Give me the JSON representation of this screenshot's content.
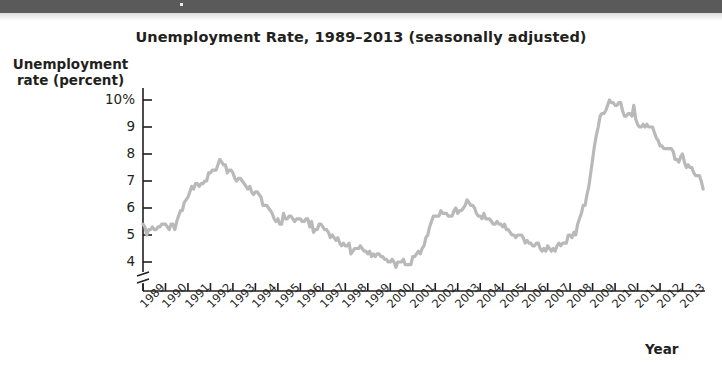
{
  "figure": {
    "title": "Unemployment Rate, 1989–2013 (seasonally adjusted)",
    "y_axis_title_line1": "Unemployment",
    "y_axis_title_line2": "rate (percent)",
    "x_axis_title": "Year"
  },
  "style": {
    "line_color": "#b9b9b9",
    "axis_color": "#231f20",
    "text_color": "#231f20",
    "band_color": "#5a5a5a",
    "background": "#ffffff"
  },
  "chart_data": {
    "type": "line",
    "title": "Unemployment Rate, 1989–2013 (seasonally adjusted)",
    "xlabel": "Year",
    "ylabel": "Unemployment rate (percent)",
    "xlim": [
      1989,
      2013.92
    ],
    "ylim": [
      3.6,
      10.6
    ],
    "ytick_labels": [
      "10%",
      "9",
      "8",
      "7",
      "6",
      "5",
      "4"
    ],
    "ytick_values": [
      10,
      9,
      8,
      7,
      6,
      5,
      4
    ],
    "xtick_labels": [
      "1989",
      "1990",
      "1991",
      "1992",
      "1993",
      "1994",
      "1995",
      "1996",
      "1997",
      "1998",
      "1999",
      "2000",
      "2001",
      "2002",
      "2003",
      "2004",
      "2005",
      "2006",
      "2007",
      "2008",
      "2009",
      "2010",
      "2011",
      "2012",
      "2013"
    ],
    "xtick_values": [
      1989,
      1990,
      1991,
      1992,
      1993,
      1994,
      1995,
      1996,
      1997,
      1998,
      1999,
      2000,
      2001,
      2002,
      2003,
      2004,
      2005,
      2006,
      2007,
      2008,
      2009,
      2010,
      2011,
      2012,
      2013
    ],
    "grid": false,
    "legend": false,
    "axis_break_y": true,
    "units": "percent",
    "frequency": "monthly",
    "series": [
      {
        "name": "Unemployment rate",
        "color": "#b9b9b9",
        "x_start": 1989.0,
        "x_step": 0.0833333,
        "values": [
          5.4,
          5.3,
          5.0,
          5.2,
          5.2,
          5.3,
          5.2,
          5.2,
          5.3,
          5.3,
          5.4,
          5.4,
          5.4,
          5.3,
          5.2,
          5.4,
          5.4,
          5.2,
          5.5,
          5.7,
          5.9,
          5.9,
          6.2,
          6.3,
          6.4,
          6.6,
          6.8,
          6.7,
          6.9,
          6.9,
          6.8,
          6.9,
          6.9,
          7.0,
          7.0,
          7.3,
          7.3,
          7.4,
          7.4,
          7.4,
          7.6,
          7.8,
          7.7,
          7.6,
          7.6,
          7.3,
          7.4,
          7.4,
          7.3,
          7.1,
          7.0,
          7.1,
          7.1,
          7.0,
          6.9,
          6.8,
          6.7,
          6.8,
          6.6,
          6.5,
          6.6,
          6.6,
          6.5,
          6.4,
          6.1,
          6.1,
          6.1,
          6.0,
          5.9,
          5.8,
          5.6,
          5.5,
          5.6,
          5.4,
          5.4,
          5.8,
          5.6,
          5.6,
          5.7,
          5.7,
          5.6,
          5.5,
          5.6,
          5.6,
          5.6,
          5.5,
          5.5,
          5.6,
          5.6,
          5.3,
          5.5,
          5.1,
          5.2,
          5.2,
          5.4,
          5.4,
          5.3,
          5.2,
          5.2,
          5.1,
          4.9,
          5.0,
          4.9,
          4.8,
          4.9,
          4.7,
          4.6,
          4.7,
          4.6,
          4.6,
          4.7,
          4.3,
          4.4,
          4.5,
          4.5,
          4.5,
          4.6,
          4.5,
          4.4,
          4.4,
          4.3,
          4.4,
          4.2,
          4.3,
          4.2,
          4.3,
          4.3,
          4.2,
          4.2,
          4.1,
          4.1,
          4.0,
          4.0,
          4.1,
          4.0,
          3.8,
          4.0,
          4.0,
          4.0,
          4.1,
          3.9,
          3.9,
          3.9,
          3.9,
          4.2,
          4.2,
          4.3,
          4.4,
          4.3,
          4.5,
          4.6,
          4.9,
          5.0,
          5.3,
          5.5,
          5.7,
          5.7,
          5.7,
          5.7,
          5.9,
          5.8,
          5.8,
          5.8,
          5.7,
          5.7,
          5.7,
          5.9,
          6.0,
          5.8,
          5.9,
          5.9,
          6.0,
          6.1,
          6.3,
          6.2,
          6.1,
          6.1,
          6.0,
          5.8,
          5.7,
          5.7,
          5.6,
          5.8,
          5.6,
          5.6,
          5.6,
          5.5,
          5.4,
          5.4,
          5.5,
          5.4,
          5.4,
          5.3,
          5.4,
          5.2,
          5.2,
          5.1,
          5.0,
          5.0,
          4.9,
          5.0,
          5.0,
          5.0,
          4.9,
          4.7,
          4.8,
          4.7,
          4.7,
          4.6,
          4.6,
          4.7,
          4.7,
          4.5,
          4.4,
          4.5,
          4.4,
          4.6,
          4.5,
          4.4,
          4.5,
          4.4,
          4.6,
          4.7,
          4.6,
          4.7,
          4.7,
          4.7,
          5.0,
          5.0,
          4.9,
          5.1,
          5.0,
          5.4,
          5.6,
          5.8,
          6.1,
          6.1,
          6.5,
          6.8,
          7.3,
          7.8,
          8.3,
          8.7,
          9.0,
          9.4,
          9.5,
          9.5,
          9.6,
          9.8,
          10.0,
          9.9,
          9.9,
          9.8,
          9.8,
          9.9,
          9.9,
          9.6,
          9.4,
          9.4,
          9.5,
          9.5,
          9.4,
          9.8,
          9.3,
          9.1,
          9.0,
          9.0,
          9.1,
          9.0,
          9.1,
          9.0,
          9.0,
          9.0,
          8.8,
          8.6,
          8.5,
          8.3,
          8.3,
          8.2,
          8.2,
          8.2,
          8.2,
          8.2,
          8.1,
          7.8,
          7.8,
          7.7,
          7.9,
          8.0,
          7.7,
          7.5,
          7.6,
          7.5,
          7.5,
          7.3,
          7.2,
          7.2,
          7.2,
          7.0,
          6.7
        ]
      }
    ]
  },
  "geometry": {
    "plot_left": 143,
    "plot_right": 705,
    "y_for_10pct": 100,
    "px_per_pct": 27,
    "x_axis_y": 291
  }
}
